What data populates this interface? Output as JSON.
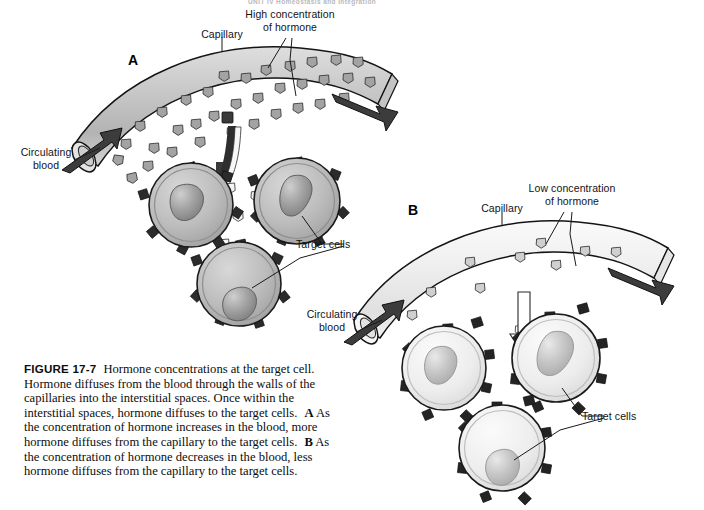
{
  "page": {
    "running_head": "UNIT IV  Homeostasis and Integration",
    "background": "#ffffff"
  },
  "figure": {
    "number": "FIGURE 17-7",
    "title": "Hormone concentrations at the target cell.",
    "caption_body_1": "Hormone diffuses from the blood through the walls of the capillaries into the interstitial spaces. Once within the interstitial spaces, hormone diffuses to the target cells.",
    "panel_a_letter": "A",
    "panel_a_text": "As the concentration of hormone increases in the blood, more hormone diffuses from the capillary to the target cells.",
    "panel_b_letter": "B",
    "panel_b_text": "As the concentration of hormone decreases in the blood, less hormone diffuses from the capillary to the target cells."
  },
  "panel_a": {
    "letter": "A",
    "labels": {
      "capillary": "Capillary",
      "hormone_concentration": "High concentration\nof hormone",
      "circulating_blood": "Circulating\nblood",
      "target_cells": "Target cells"
    },
    "colors": {
      "vessel_fill": "#c9c9c9",
      "vessel_stroke": "#1a1a1a",
      "particle_fill": "#9e9e9e",
      "cell_fill": "#b9b9b9",
      "nucleus_fill": "#8f8f8f",
      "receptor_fill": "#2b2b2b",
      "arrow_fill": "#3a3a3a"
    },
    "counts": {
      "hormone_in_vessel": 34,
      "hormone_in_interstitium": 9,
      "target_cells": 3,
      "receptors_per_cell": 7
    }
  },
  "panel_b": {
    "letter": "B",
    "labels": {
      "capillary": "Capillary",
      "hormone_concentration": "Low concentration\nof hormone",
      "circulating_blood": "Circulating\nblood",
      "target_cells": "Target cells"
    },
    "colors": {
      "vessel_fill": "#ededed",
      "vessel_stroke": "#1a1a1a",
      "particle_fill": "#c4c4c4",
      "cell_fill": "#e6e6e6",
      "nucleus_fill": "#b4b4b4",
      "receptor_fill": "#242424",
      "arrow_fill": "#ffffff"
    },
    "counts": {
      "hormone_in_vessel": 9,
      "hormone_in_interstitium": 3,
      "target_cells": 3,
      "receptors_per_cell": 8
    }
  },
  "diagram_data": {
    "type": "biological-illustration",
    "subject": "Hormone concentration at the target cell",
    "panels": [
      {
        "id": "A",
        "hormone_level": "high",
        "diffusion": "more hormone diffuses to target cells"
      },
      {
        "id": "B",
        "hormone_level": "low",
        "diffusion": "less hormone diffuses to target cells"
      }
    ]
  }
}
